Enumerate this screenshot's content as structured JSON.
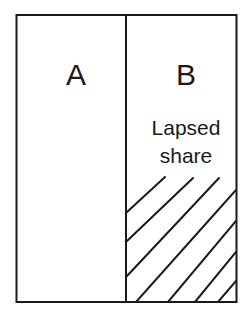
{
  "diagram": {
    "type": "share-division",
    "sections": [
      {
        "id": "A",
        "label": "A",
        "shaded": false
      },
      {
        "id": "B",
        "label": "B",
        "shaded": true,
        "note_line1": "Lapsed",
        "note_line2": "share"
      }
    ],
    "colors": {
      "stroke": "#1a1a1a",
      "background": "#ffffff"
    }
  }
}
